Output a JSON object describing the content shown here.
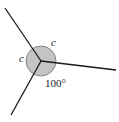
{
  "diagram": {
    "labels": {
      "angle_c_top": "c",
      "angle_c_left": "c",
      "angle_bottom": "100°"
    },
    "colors": {
      "line": "#1a1a1a",
      "circle_fill": "#c4c4c4",
      "circle_stroke": "#6e6e6e"
    }
  }
}
